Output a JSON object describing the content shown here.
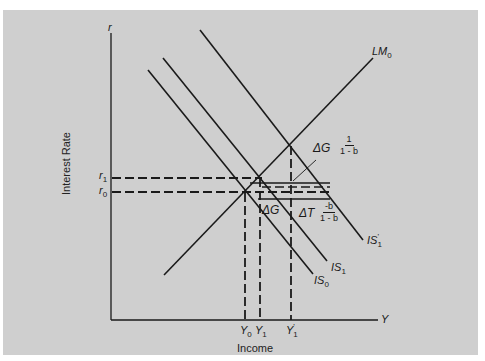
{
  "diagram": {
    "axes": {
      "y_axis_symbol": "r",
      "x_axis_symbol": "Y",
      "y_axis_label": "Interest Rate",
      "x_axis_label": "Income"
    },
    "curves": {
      "lm0": {
        "name": "LM",
        "sub": "0"
      },
      "is0": {
        "name": "IS",
        "sub": "0"
      },
      "is1": {
        "name": "IS",
        "sub": "1"
      },
      "is1p": {
        "name": "IS",
        "sub": "1",
        "prime": "'"
      }
    },
    "y_ticks": {
      "r1": {
        "name": "r",
        "sub": "1"
      },
      "r0": {
        "name": "r",
        "sub": "0"
      }
    },
    "x_ticks": {
      "y0": {
        "name": "Y",
        "sub": "0"
      },
      "y1": {
        "name": "Y",
        "sub": "1"
      },
      "y1p": {
        "name": "Y",
        "sub": "1",
        "prime": "'"
      }
    },
    "annotations": {
      "delta_g_multiplier": {
        "text": "ΔG",
        "num": "1",
        "den": "1 - b"
      },
      "delta_g": {
        "text": "ΔG"
      },
      "delta_t_multiplier": {
        "text": "ΔT",
        "num": "-b",
        "den": "1 - b"
      }
    },
    "colors": {
      "background": "#cfcfcf",
      "line": "#1a1a1a"
    }
  }
}
